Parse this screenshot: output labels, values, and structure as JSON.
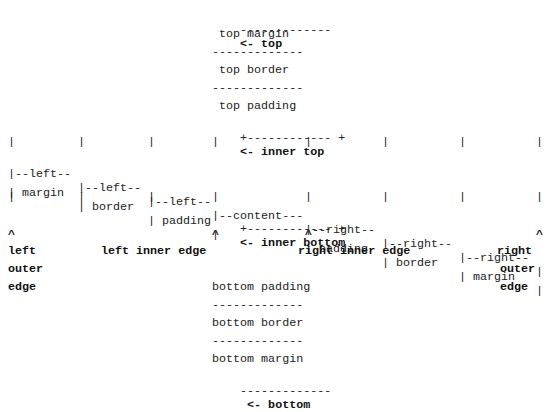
{
  "diagram": {
    "lines": [
      {
        "pre": "                             -------------",
        "label": " <- top"
      },
      {
        "pre": "                              top margin",
        "label": ""
      },
      {
        "pre": "                             -------------",
        "label": ""
      },
      {
        "pre": "                              top border",
        "label": ""
      },
      {
        "pre": "                             -------------",
        "label": ""
      },
      {
        "pre": "                              top padding",
        "label": ""
      },
      {
        "pre": "                             +------------ +",
        "label": " <- inner top"
      },
      {
        "pre": "|            |           |           |              |           |           |           |",
        "label": ""
      },
      {
        "pre": "|--left--    |--left--   |--left--   |--content---  |--right--  |--right--  |--right--  |",
        "label": ""
      },
      {
        "pre": "| margin     | border    | padding   |              | padding   | border    | margin    |",
        "label": ""
      },
      {
        "pre": "|            |           |           |              |           |           |           |",
        "label": ""
      },
      {
        "pre": "                             +------------ +",
        "label": " <- inner bottom"
      },
      {
        "pre": "^                            ^             ^                                          ^",
        "label": ""
      }
    ],
    "edge_labels": {
      "left_outer": [
        "left",
        "outer",
        "edge"
      ],
      "left_inner": "left inner edge",
      "right_inner": "right inner edge",
      "right_outer": [
        "right",
        "outer",
        "edge"
      ]
    },
    "bottom_lines": [
      {
        "text": "bottom padding",
        "label": ""
      },
      {
        "text": "-------------",
        "label": ""
      },
      {
        "text": "bottom border",
        "label": ""
      },
      {
        "text": "-------------",
        "label": ""
      },
      {
        "text": "bottom margin",
        "label": ""
      },
      {
        "text": "-------------",
        "label": " <- bottom"
      }
    ],
    "top_block": {
      "top_rule": "-------------",
      "top_label": "<- top",
      "top_margin": "top margin",
      "top_border": "top border",
      "top_padding": "top padding",
      "inner_top_rule": "+------------ +",
      "inner_top_label": "<- inner top"
    },
    "columns": {
      "left_margin": [
        "|--left--",
        "| margin"
      ],
      "left_border": [
        "|--left--",
        "| border"
      ],
      "left_padding": [
        "|--left--",
        "| padding"
      ],
      "content": [
        "|--content---",
        "|"
      ],
      "right_padding": [
        "|--right--",
        "| padding"
      ],
      "right_border": [
        "|--right--",
        "| border"
      ],
      "right_margin": [
        "|--right--",
        "| margin"
      ],
      "outer_right": [
        "|",
        "|"
      ]
    },
    "inner_bottom_rule": "+------------ +",
    "inner_bottom_label": "<- inner bottom",
    "caret": "^"
  }
}
